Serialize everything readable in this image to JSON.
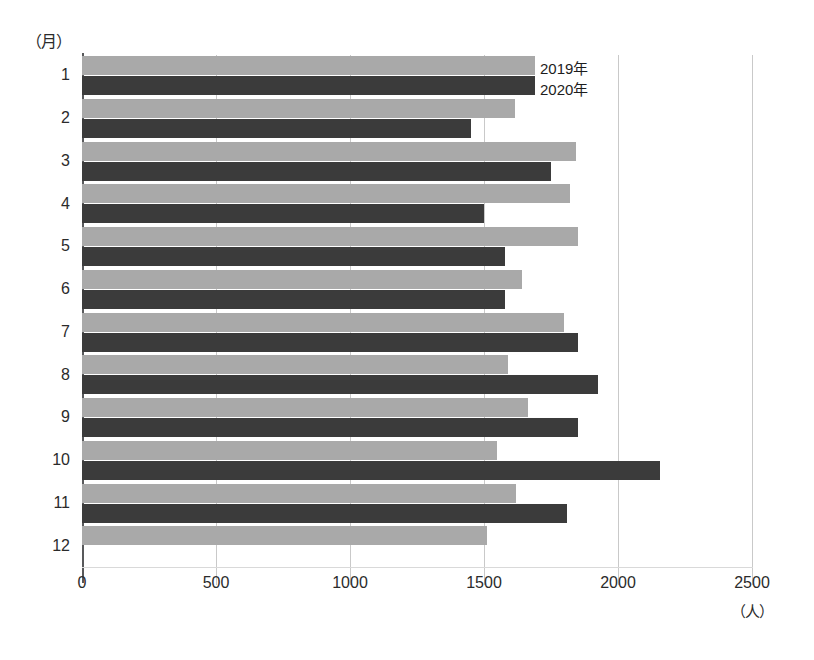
{
  "chart_data": {
    "type": "bar",
    "orientation": "horizontal",
    "title": "",
    "xlabel": "（人）",
    "ylabel": "（月）",
    "categories": [
      "1",
      "2",
      "3",
      "4",
      "5",
      "6",
      "7",
      "8",
      "9",
      "10",
      "11",
      "12"
    ],
    "series": [
      {
        "name": "2019年",
        "color": "#a9a9a9",
        "values": [
          1690,
          1615,
          1845,
          1820,
          1850,
          1640,
          1800,
          1590,
          1665,
          1550,
          1620,
          1510
        ]
      },
      {
        "name": "2020年",
        "color": "#3b3b3b",
        "values": [
          1690,
          1450,
          1750,
          1500,
          1580,
          1580,
          1850,
          1925,
          1850,
          2155,
          1810,
          null
        ]
      }
    ],
    "xlim": [
      0,
      2500
    ],
    "xticks": [
      "0",
      "500",
      "1000",
      "1500",
      "2000",
      "2500"
    ],
    "xtick_values": [
      0,
      500,
      1000,
      1500,
      2000,
      2500
    ],
    "grid": true,
    "grid_axis": "x",
    "legend_position": "inside-top-right"
  },
  "axis": {
    "y_unit_label": "（月）",
    "x_unit_label": "（人）"
  },
  "legend": {
    "items": [
      {
        "label": "2019年"
      },
      {
        "label": "2020年"
      }
    ]
  },
  "colors": {
    "series_2019": "#a9a9a9",
    "series_2020": "#3b3b3b",
    "axis": "#58595b",
    "grid": "#c9c9c9",
    "text": "#2b2b2b",
    "background": "#ffffff"
  }
}
